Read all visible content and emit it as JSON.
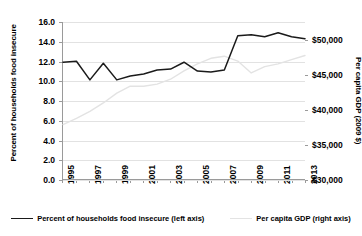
{
  "chart_data": {
    "type": "line",
    "title": "",
    "xlabel": "",
    "x": [
      1995,
      1996,
      1997,
      1998,
      1999,
      2000,
      2001,
      2002,
      2003,
      2004,
      2005,
      2006,
      2007,
      2008,
      2009,
      2010,
      2011,
      2012,
      2013
    ],
    "xtick_labels": [
      "1995",
      "1997",
      "1999",
      "2001",
      "2003",
      "2005",
      "2007",
      "2009",
      "2011",
      "2013"
    ],
    "xlim": [
      1995,
      2013
    ],
    "grid": true,
    "legend_position": "bottom",
    "left_axis": {
      "label": "Percent of households food insecure",
      "ylim": [
        0.0,
        16.0
      ],
      "tick_labels": [
        "0.0",
        "2.0",
        "4.0",
        "6.0",
        "8.0",
        "10.0",
        "12.0",
        "14.0",
        "16.0"
      ],
      "tick_values": [
        0.0,
        2.0,
        4.0,
        6.0,
        8.0,
        10.0,
        12.0,
        14.0,
        16.0
      ]
    },
    "right_axis": {
      "label": "Per capita GDP (2009 $)",
      "ylim": [
        30000,
        52500
      ],
      "tick_labels": [
        "$30,000",
        "$35,000",
        "$40,000",
        "$45,000",
        "$50,000"
      ],
      "tick_values": [
        30000,
        35000,
        40000,
        45000,
        50000
      ]
    },
    "series": [
      {
        "name": "Percent of households food insecure (left axis)",
        "axis": "left",
        "color": "#1a1a1a",
        "values": [
          11.9,
          12.0,
          10.1,
          11.8,
          10.1,
          10.5,
          10.7,
          11.1,
          11.2,
          11.9,
          11.0,
          10.9,
          11.1,
          14.6,
          14.7,
          14.5,
          14.9,
          14.5,
          14.3
        ]
      },
      {
        "name": "Per capita GDP (right axis)",
        "axis": "right",
        "color": "#e3e3e3",
        "values": [
          37800,
          38700,
          39700,
          40900,
          42300,
          43300,
          43300,
          43600,
          44300,
          45500,
          46500,
          47300,
          47600,
          46900,
          45200,
          46100,
          46500,
          47100,
          47700
        ]
      }
    ]
  },
  "legend": {
    "items": [
      {
        "label": "Percent of households food insecure (left axis)"
      },
      {
        "label": "Per capita GDP (right axis)"
      }
    ]
  }
}
